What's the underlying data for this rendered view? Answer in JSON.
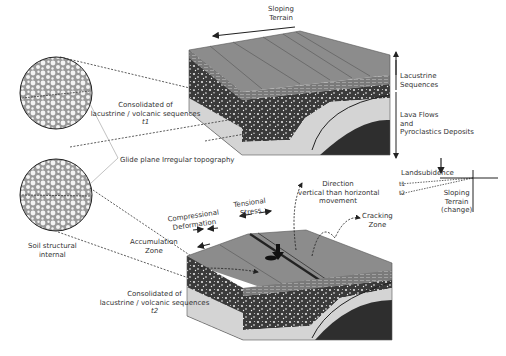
{
  "diagram": {
    "type": "geological-cross-section",
    "colors": {
      "top_surface": "#8a8a8a",
      "lacustrine": "#6e6e6e",
      "lava_deposits": "#3a3a3a",
      "bedrock_light": "#d4d4d4",
      "bedrock_dark": "#2e2e2e",
      "text": "#333333"
    },
    "labels": {
      "sloping_terrain_top": [
        "Sloping",
        "Terrain"
      ],
      "lacustrine": [
        "Lacustrine",
        "Sequences"
      ],
      "lava": [
        "Lava Flows",
        "and",
        "Pyroclastics Deposits"
      ],
      "consolidated_t1": [
        "Consolidated of",
        "lacustrine / volcanic sequences",
        "t1"
      ],
      "glide_plane": "Glide plane",
      "irregular_topography": "Irregular topography",
      "landsubsidence": "Landsubidence",
      "t1": "t1",
      "t2": "t2",
      "sloping_terrain_change": [
        "Sloping",
        "Terrain",
        "(change)"
      ],
      "direction": [
        "Direction",
        "vertical than horizontal",
        "movement"
      ],
      "cracking_zone": [
        "Cracking",
        "Zone"
      ],
      "compressional": [
        "Compressional",
        "Deformation"
      ],
      "tensional": [
        "Tensional",
        "Stress"
      ],
      "accumulation": [
        "Accumulation",
        "Zone"
      ],
      "soil_structural": [
        "Soil structural",
        "internal"
      ],
      "consolidated_t2": [
        "Consolidated of",
        "lacustrine / volcanic sequences",
        "t2"
      ]
    }
  }
}
